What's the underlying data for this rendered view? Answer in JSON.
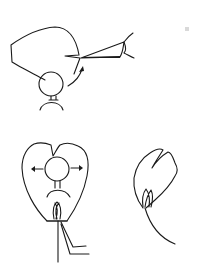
{
  "diagram": {
    "colors": {
      "stroke": "#1a1a1a",
      "background": "#ffffff"
    },
    "panels": [
      {
        "id": "top",
        "label": ""
      },
      {
        "id": "bottom-left",
        "label": ""
      },
      {
        "id": "bottom-right",
        "label": ""
      }
    ]
  }
}
